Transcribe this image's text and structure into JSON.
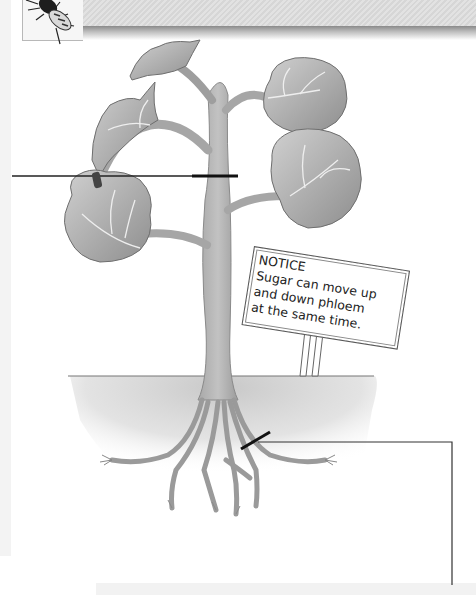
{
  "header": {
    "title_clipped": "",
    "icon": "aphid-icon"
  },
  "notice_sign": {
    "heading": "NOTICE",
    "lines": [
      "Sugar can move up",
      "and down phloem",
      "at  the same time."
    ]
  },
  "colors": {
    "leaf_fill": "#a8a8a8",
    "stem_fill": "#b4b4b4",
    "soil_fill": "#d4d4d4",
    "marker": "#1a1a1a",
    "header_band": "#dcdcdc"
  }
}
